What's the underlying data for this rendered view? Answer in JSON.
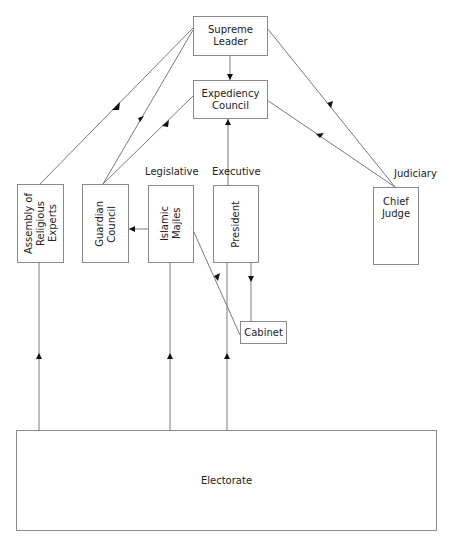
{
  "nodes": {
    "supreme_leader": "Supreme\nLeader",
    "expediency_council": "Expediency\nCouncil",
    "assembly": "Assembly of\nReligious\nExperts",
    "guardian_council": "Guardian\nCouncil",
    "islamic_majles": "Islamic\nMajles",
    "president": "President",
    "chief_judge": "Chief\nJudge",
    "cabinet": "Cabinet",
    "electorate": "Electorate"
  },
  "branch_labels": {
    "legislative": "Legislative",
    "executive": "Executive",
    "judiciary": "Judiciary"
  },
  "colors": {
    "line": "#7a7a7a",
    "arrow": "#111111",
    "border": "#8a8a8a"
  }
}
